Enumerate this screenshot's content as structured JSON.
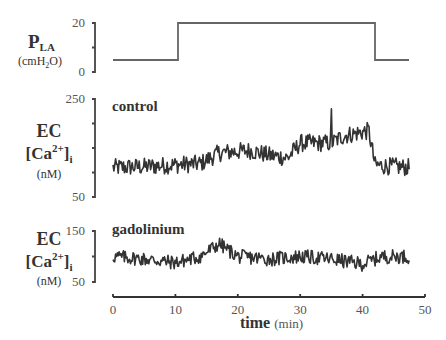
{
  "chart_data": [
    {
      "type": "line",
      "panel": "pressure",
      "ylabel_main": "P",
      "ylabel_sub": "LA",
      "ylabel_unit_pre": "(cmH",
      "ylabel_unit_sub": "2",
      "ylabel_unit_post": "O)",
      "yticks": [
        "0",
        "20"
      ],
      "ylim": [
        0,
        20
      ],
      "x": [
        0,
        10.5,
        10.5,
        42,
        42,
        47.5
      ],
      "values": [
        5,
        5,
        20,
        20,
        5,
        5
      ],
      "color": "#555555"
    },
    {
      "type": "line",
      "panel": "control",
      "title": "control",
      "ylabel_line1": "EC",
      "ylabel_line2_pre": "[Ca",
      "ylabel_line2_sup": "2+",
      "ylabel_line2_post": "]",
      "ylabel_line2_sub": "i",
      "ylabel_unit": "(nM)",
      "yticks": [
        "50",
        "250"
      ],
      "ylim": [
        50,
        250
      ],
      "x_range": [
        0,
        47.5
      ],
      "trend": [
        [
          0,
          110
        ],
        [
          5,
          112
        ],
        [
          9,
          115
        ],
        [
          14,
          118
        ],
        [
          17,
          140
        ],
        [
          22,
          145
        ],
        [
          25,
          135
        ],
        [
          28,
          130
        ],
        [
          30,
          160
        ],
        [
          35,
          160
        ],
        [
          37,
          175
        ],
        [
          41,
          185
        ],
        [
          42,
          115
        ],
        [
          47.5,
          110
        ]
      ],
      "notable": {
        "spike_at_min": 35,
        "spike_value": 230
      },
      "color": "#333333"
    },
    {
      "type": "line",
      "panel": "gadolinium",
      "title": "gadolinium",
      "ylabel_line1": "EC",
      "ylabel_line2_pre": "[Ca",
      "ylabel_line2_sup": "2+",
      "ylabel_line2_post": "]",
      "ylabel_line2_sub": "i",
      "ylabel_unit": "(nM)",
      "yticks": [
        "50",
        "150"
      ],
      "ylim": [
        50,
        150
      ],
      "x_range": [
        0,
        47.5
      ],
      "trend": [
        [
          0,
          100
        ],
        [
          5,
          95
        ],
        [
          10,
          88
        ],
        [
          14,
          100
        ],
        [
          17,
          125
        ],
        [
          20,
          100
        ],
        [
          25,
          95
        ],
        [
          30,
          100
        ],
        [
          35,
          95
        ],
        [
          40,
          85
        ],
        [
          43,
          100
        ],
        [
          47.5,
          100
        ]
      ],
      "color": "#333333"
    }
  ],
  "xaxis": {
    "ticks": [
      "0",
      "10",
      "20",
      "30",
      "40",
      "50"
    ],
    "xlim": [
      0,
      50
    ],
    "label_main": "time",
    "label_unit": "(min)"
  }
}
